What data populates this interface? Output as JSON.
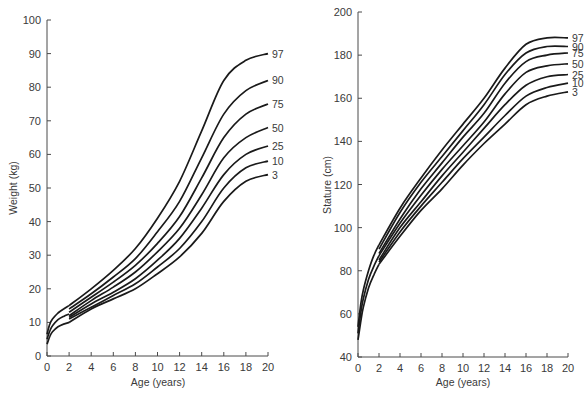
{
  "chart_data": [
    {
      "type": "line",
      "title": "",
      "xlabel": "Age (years)",
      "ylabel": "Weight (kg)",
      "xlim": [
        0,
        20
      ],
      "ylim": [
        0,
        100
      ],
      "xticks": [
        0,
        2,
        4,
        6,
        8,
        10,
        12,
        14,
        16,
        18,
        20
      ],
      "yticks": [
        0,
        10,
        20,
        30,
        40,
        50,
        60,
        70,
        80,
        90,
        100
      ],
      "grid": false,
      "legend": "inline labels at right end of curves",
      "x": [
        2,
        4,
        6,
        8,
        10,
        12,
        14,
        16,
        18,
        20
      ],
      "series": [
        {
          "name": "97",
          "values": [
            15,
            20,
            25.5,
            32,
            41,
            52,
            67,
            82,
            88,
            90
          ]
        },
        {
          "name": "90",
          "values": [
            14,
            18.5,
            23.5,
            29,
            37,
            46,
            59,
            72,
            79,
            82
          ]
        },
        {
          "name": "75",
          "values": [
            13,
            17.5,
            22,
            27,
            33.5,
            41.5,
            53,
            65,
            72,
            75
          ]
        },
        {
          "name": "50",
          "values": [
            12,
            16.5,
            20.5,
            25,
            31,
            38,
            48,
            59,
            65,
            68
          ]
        },
        {
          "name": "25",
          "values": [
            11.5,
            15.5,
            19,
            23,
            28.5,
            35,
            44,
            54,
            60,
            62.5
          ]
        },
        {
          "name": "10",
          "values": [
            11,
            14.5,
            18,
            21.5,
            26.5,
            32,
            40,
            50,
            56,
            58
          ]
        },
        {
          "name": "3",
          "values": [
            10,
            14,
            17,
            20,
            24.5,
            29.5,
            36.5,
            46,
            52,
            54
          ]
        }
      ],
      "infant_x": [
        0,
        0.25,
        0.5,
        1,
        1.5,
        2
      ],
      "infant_series": [
        {
          "name": "upper",
          "values": [
            6.5,
            9.5,
            11,
            12.8,
            14,
            15
          ]
        },
        {
          "name": "middle",
          "values": [
            5,
            7.5,
            9,
            10.8,
            11.8,
            12.5
          ]
        },
        {
          "name": "lower",
          "values": [
            3.5,
            5.8,
            7.2,
            8.7,
            9.5,
            10
          ]
        }
      ]
    },
    {
      "type": "line",
      "title": "",
      "xlabel": "Age (years)",
      "ylabel": "Stature (cm)",
      "xlim": [
        0,
        20
      ],
      "ylim": [
        40,
        200
      ],
      "xticks": [
        0,
        2,
        4,
        6,
        8,
        10,
        12,
        14,
        16,
        18,
        20
      ],
      "yticks": [
        40,
        60,
        80,
        100,
        120,
        140,
        160,
        180,
        200
      ],
      "grid": false,
      "legend": "inline labels at right end of curves",
      "x": [
        2,
        4,
        6,
        8,
        10,
        12,
        14,
        16,
        18,
        20
      ],
      "series": [
        {
          "name": "97",
          "values": [
            92,
            109,
            123,
            136,
            148,
            160,
            174,
            185,
            188,
            188
          ]
        },
        {
          "name": "90",
          "values": [
            90,
            107,
            121,
            133,
            145,
            157,
            171,
            181,
            184,
            184
          ]
        },
        {
          "name": "75",
          "values": [
            88,
            104,
            118,
            130,
            142,
            153,
            167,
            177,
            180,
            181
          ]
        },
        {
          "name": "50",
          "values": [
            87,
            102,
            115,
            127,
            138,
            149,
            162,
            172,
            175,
            176
          ]
        },
        {
          "name": "25",
          "values": [
            85,
            100,
            112,
            124,
            135,
            146,
            157,
            166,
            170,
            171
          ]
        },
        {
          "name": "10",
          "values": [
            84,
            98,
            110,
            121,
            132,
            142,
            152,
            161,
            165,
            167
          ]
        },
        {
          "name": "3",
          "values": [
            83,
            96,
            108,
            118,
            129,
            139,
            148,
            157,
            161,
            163
          ]
        }
      ],
      "infant_x": [
        0,
        0.25,
        0.5,
        1,
        1.5,
        2
      ],
      "infant_series": [
        {
          "name": "upper",
          "values": [
            54,
            64,
            71,
            80,
            87,
            92
          ]
        },
        {
          "name": "middle",
          "values": [
            51,
            60,
            67,
            76,
            82,
            87
          ]
        },
        {
          "name": "lower",
          "values": [
            48,
            56,
            63,
            72,
            78,
            83
          ]
        }
      ]
    }
  ],
  "panels": [
    {
      "x0": 47,
      "x1": 268,
      "y0": 356,
      "y1": 20
    },
    {
      "x0": 358,
      "x1": 568,
      "y0": 357,
      "y1": 12
    }
  ]
}
